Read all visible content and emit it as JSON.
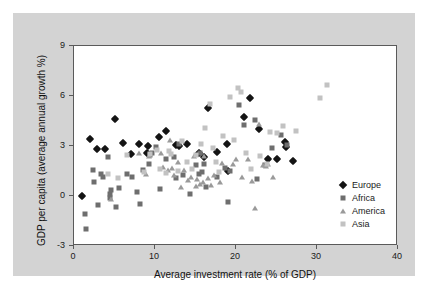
{
  "chart_data": {
    "type": "scatter",
    "title": "",
    "xlabel": "Average investment rate (% of GDP)",
    "ylabel": "GDP per capita (average annual growth %)",
    "xlim": [
      0,
      40
    ],
    "ylim": [
      -3,
      9
    ],
    "xticks": [
      0,
      10,
      20,
      30,
      40
    ],
    "yticks": [
      -3,
      0,
      3,
      6,
      9
    ],
    "grid": false,
    "legend_position": "inside-right",
    "series": [
      {
        "name": "Europe",
        "marker": "diamond",
        "color": "#141414",
        "points": [
          [
            1.0,
            0.0
          ],
          [
            2.0,
            3.45
          ],
          [
            2.9,
            2.8
          ],
          [
            3.8,
            2.85
          ],
          [
            5.0,
            4.6
          ],
          [
            6.0,
            3.2
          ],
          [
            7.0,
            2.5
          ],
          [
            8.0,
            3.1
          ],
          [
            9.1,
            3.0
          ],
          [
            9.0,
            2.6
          ],
          [
            10.5,
            3.55
          ],
          [
            11.3,
            3.9
          ],
          [
            12.6,
            3.05
          ],
          [
            13.0,
            3.0
          ],
          [
            14.0,
            3.1
          ],
          [
            15.4,
            2.6
          ],
          [
            16.0,
            2.35
          ],
          [
            16.6,
            5.3
          ],
          [
            17.7,
            2.65
          ],
          [
            18.9,
            3.1
          ],
          [
            19.0,
            1.5
          ],
          [
            21.0,
            4.75
          ],
          [
            21.7,
            5.9
          ],
          [
            22.8,
            4.05
          ],
          [
            24.0,
            2.2
          ],
          [
            25.0,
            2.2
          ],
          [
            26.0,
            3.25
          ],
          [
            26.2,
            2.95
          ],
          [
            27.0,
            2.1
          ]
        ]
      },
      {
        "name": "Africa",
        "marker": "square",
        "color": "#6e6e6e",
        "points": [
          [
            1.3,
            -1.1
          ],
          [
            1.5,
            -2.0
          ],
          [
            2.3,
            1.55
          ],
          [
            2.5,
            0.85
          ],
          [
            3.0,
            -0.55
          ],
          [
            3.3,
            1.35
          ],
          [
            3.6,
            1.15
          ],
          [
            4.2,
            2.35
          ],
          [
            4.4,
            0.1
          ],
          [
            4.5,
            -0.1
          ],
          [
            4.6,
            0.35
          ],
          [
            5.2,
            -0.65
          ],
          [
            5.6,
            0.5
          ],
          [
            6.6,
            1.35
          ],
          [
            7.2,
            1.15
          ],
          [
            7.8,
            0.25
          ],
          [
            8.2,
            -0.5
          ],
          [
            8.5,
            1.55
          ],
          [
            9.3,
            1.9
          ],
          [
            9.4,
            2.45
          ],
          [
            9.6,
            2.6
          ],
          [
            10.1,
            2.95
          ],
          [
            10.6,
            0.45
          ],
          [
            11.3,
            2.2
          ],
          [
            12.3,
            2.35
          ],
          [
            12.6,
            1.1
          ],
          [
            13.0,
            3.15
          ],
          [
            13.4,
            1.25
          ],
          [
            14.3,
            0.15
          ],
          [
            15.0,
            1.85
          ],
          [
            15.4,
            1.35
          ],
          [
            15.6,
            2.6
          ],
          [
            15.8,
            1.45
          ],
          [
            16.1,
            1.9
          ],
          [
            16.3,
            0.55
          ],
          [
            17.6,
            1.15
          ],
          [
            18.6,
            1.7
          ],
          [
            19.0,
            -0.35
          ],
          [
            19.3,
            1.5
          ],
          [
            20.4,
            5.45
          ],
          [
            21.0,
            4.25
          ],
          [
            22.3,
            4.55
          ],
          [
            22.6,
            1.05
          ],
          [
            23.6,
            1.85
          ],
          [
            24.4,
            2.9
          ],
          [
            25.5,
            3.65
          ],
          [
            26.3,
            3.05
          ]
        ]
      },
      {
        "name": "America",
        "marker": "triangle",
        "color": "#9a9a9a",
        "points": [
          [
            4.6,
            -0.15
          ],
          [
            8.9,
            1.3
          ],
          [
            9.3,
            2.4
          ],
          [
            10.8,
            2.6
          ],
          [
            11.0,
            1.75
          ],
          [
            11.6,
            1.55
          ],
          [
            11.9,
            3.35
          ],
          [
            12.1,
            1.7
          ],
          [
            12.4,
            1.25
          ],
          [
            12.9,
            2.05
          ],
          [
            13.2,
            0.55
          ],
          [
            13.6,
            1.55
          ],
          [
            14.1,
            0.95
          ],
          [
            14.4,
            1.15
          ],
          [
            14.8,
            2.4
          ],
          [
            15.0,
            0.6
          ],
          [
            15.2,
            1.0
          ],
          [
            15.5,
            0.75
          ],
          [
            15.9,
            0.85
          ],
          [
            16.1,
            2.4
          ],
          [
            16.5,
            1.1
          ],
          [
            16.9,
            0.65
          ],
          [
            17.3,
            1.25
          ],
          [
            18.0,
            0.85
          ],
          [
            18.3,
            2.0
          ],
          [
            19.6,
            1.95
          ],
          [
            20.0,
            2.25
          ],
          [
            20.8,
            1.15
          ],
          [
            21.5,
            2.2
          ],
          [
            22.0,
            0.9
          ],
          [
            22.4,
            -0.7
          ],
          [
            22.9,
            4.35
          ],
          [
            23.3,
            1.85
          ],
          [
            23.7,
            1.8
          ],
          [
            24.0,
            1.95
          ],
          [
            24.6,
            1.15
          ],
          [
            8.0,
            2.6
          ]
        ]
      },
      {
        "name": "Asia",
        "marker": "square",
        "color": "#c2c2c2",
        "points": [
          [
            4.2,
            1.35
          ],
          [
            5.4,
            1.1
          ],
          [
            6.5,
            2.45
          ],
          [
            8.6,
            1.45
          ],
          [
            9.4,
            2.55
          ],
          [
            10.3,
            2.75
          ],
          [
            10.6,
            1.6
          ],
          [
            11.4,
            1.4
          ],
          [
            12.0,
            2.55
          ],
          [
            12.8,
            1.5
          ],
          [
            13.3,
            3.3
          ],
          [
            13.9,
            2.05
          ],
          [
            14.6,
            1.6
          ],
          [
            15.1,
            2.45
          ],
          [
            15.7,
            3.1
          ],
          [
            16.2,
            4.1
          ],
          [
            16.8,
            5.55
          ],
          [
            17.2,
            2.9
          ],
          [
            17.9,
            1.45
          ],
          [
            18.4,
            3.6
          ],
          [
            19.2,
            5.95
          ],
          [
            19.7,
            3.35
          ],
          [
            20.2,
            6.5
          ],
          [
            20.6,
            6.25
          ],
          [
            21.2,
            2.6
          ],
          [
            21.8,
            1.6
          ],
          [
            23.0,
            2.4
          ],
          [
            23.8,
            1.9
          ],
          [
            24.2,
            3.85
          ],
          [
            25.0,
            3.8
          ],
          [
            25.8,
            4.2
          ],
          [
            27.4,
            3.9
          ],
          [
            30.4,
            5.9
          ],
          [
            31.2,
            6.65
          ],
          [
            17.5,
            2.05
          ],
          [
            11.7,
            2.7
          ]
        ]
      }
    ]
  },
  "axes": {
    "xticklabels": [
      "0",
      "10",
      "20",
      "30",
      "40"
    ],
    "yticklabels": [
      "9",
      "6",
      "3",
      "0",
      "-3"
    ]
  },
  "legend": {
    "items": [
      {
        "label": "Europe",
        "marker": "diamond",
        "color": "#141414"
      },
      {
        "label": "Africa",
        "marker": "square",
        "color": "#6e6e6e"
      },
      {
        "label": "America",
        "marker": "triangle",
        "color": "#9a9a9a"
      },
      {
        "label": "Asia",
        "marker": "square",
        "color": "#c2c2c2"
      }
    ]
  }
}
